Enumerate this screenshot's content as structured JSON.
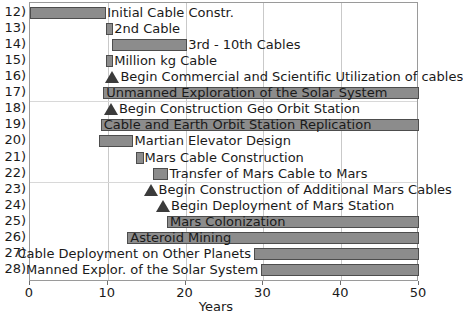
{
  "chart_data": {
    "type": "bar",
    "subtype": "gantt",
    "title": "",
    "xlabel": "Years",
    "ylabel": "",
    "xlim": [
      0,
      50
    ],
    "xticks": [
      0,
      10,
      20,
      30,
      40,
      50
    ],
    "xtick_labels": [
      "0",
      "10",
      "20",
      "30",
      "40",
      "50"
    ],
    "grid": "vertical-major-and-horizontal-group",
    "legend": "none",
    "colors": {
      "bar_fill": "#8c8c8c",
      "bar_border": "#4d4d4d",
      "milestone": "#3b3b3b",
      "grid": "#c9c9c9",
      "frame": "#9a9a9a",
      "text": "#1a1a1a",
      "background": "#ffffff"
    },
    "row_numbers": [
      "12)",
      "13)",
      "14)",
      "15)",
      "16)",
      "17)",
      "18)",
      "19)",
      "20)",
      "21)",
      "22)",
      "23)",
      "24)",
      "25)",
      "26)",
      "27)",
      "28)"
    ],
    "tasks": [
      {
        "row": "12)",
        "label": "Initial Cable Constr.",
        "kind": "bar",
        "start": 0,
        "end": 9.8,
        "label_side": "right"
      },
      {
        "row": "13)",
        "label": "2nd Cable",
        "kind": "bar",
        "start": 9.8,
        "end": 10.7,
        "label_side": "right"
      },
      {
        "row": "14)",
        "label": "3rd - 10th Cables",
        "kind": "bar",
        "start": 10.5,
        "end": 20.2,
        "label_side": "right"
      },
      {
        "row": "15)",
        "label": "Million kg Cable",
        "kind": "bar",
        "start": 9.8,
        "end": 10.7,
        "label_side": "right"
      },
      {
        "row": "16)",
        "label": "Begin Commercial and Scientific Utilization of cables",
        "kind": "milestone",
        "start": 10.6,
        "end": 10.6,
        "label_side": "right"
      },
      {
        "row": "17)",
        "label": "Unmanned Exploration of the Solar System",
        "kind": "bar",
        "start": 9.4,
        "end": 50,
        "label_side": "inside"
      },
      {
        "row": "18)",
        "label": "Begin Construction Geo Orbit Station",
        "kind": "milestone",
        "start": 10.4,
        "end": 10.4,
        "label_side": "right"
      },
      {
        "row": "19)",
        "label": "Cable and Earth Orbit  Station Replication",
        "kind": "bar",
        "start": 9.1,
        "end": 50,
        "label_side": "inside"
      },
      {
        "row": "20)",
        "label": "Martian Elevator Design",
        "kind": "bar",
        "start": 8.9,
        "end": 13.3,
        "label_side": "right"
      },
      {
        "row": "21)",
        "label": "Mars Cable Construction",
        "kind": "bar",
        "start": 13.6,
        "end": 14.6,
        "label_side": "right"
      },
      {
        "row": "22)",
        "label": "Transfer of Mars Cable to Mars",
        "kind": "bar",
        "start": 15.8,
        "end": 17.8,
        "label_side": "right"
      },
      {
        "row": "23)",
        "label": "Begin Construction of Additional Mars Cables",
        "kind": "milestone",
        "start": 15.5,
        "end": 15.5,
        "label_side": "right"
      },
      {
        "row": "24)",
        "label": "Begin Deployment of Mars Station",
        "kind": "milestone",
        "start": 17.1,
        "end": 17.1,
        "label_side": "right"
      },
      {
        "row": "25)",
        "label": "Mars Colonization",
        "kind": "bar",
        "start": 17.6,
        "end": 50,
        "label_side": "inside"
      },
      {
        "row": "26)",
        "label": "Asteroid Mining",
        "kind": "bar",
        "start": 12.5,
        "end": 50,
        "label_side": "inside"
      },
      {
        "row": "27)",
        "label": "Cable Deployment on Other Planets",
        "kind": "bar",
        "start": 28.8,
        "end": 50,
        "label_side": "left"
      },
      {
        "row": "28)",
        "label": "Manned Explor. of the Solar System",
        "kind": "bar",
        "start": 29.7,
        "end": 50,
        "label_side": "left"
      }
    ],
    "group_separators_after_rows": [
      "17)",
      "22)"
    ]
  }
}
